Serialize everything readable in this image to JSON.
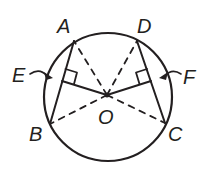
{
  "figure": {
    "type": "geometry-circle-chords",
    "colors": {
      "ink": "#231f20",
      "background": "#ffffff"
    },
    "circle": {
      "center_label": "O",
      "cx": 108,
      "cy": 97,
      "r": 64
    },
    "points": {
      "A": {
        "label": "A",
        "x": 74,
        "y": 41
      },
      "D": {
        "label": "D",
        "x": 137,
        "y": 41
      },
      "B": {
        "label": "B",
        "x": 50,
        "y": 124
      },
      "C": {
        "label": "C",
        "x": 165,
        "y": 123
      },
      "O": {
        "label": "O",
        "x": 107,
        "y": 95
      },
      "E": {
        "label": "E",
        "x": 62,
        "y": 81
      },
      "F": {
        "label": "F",
        "x": 151,
        "y": 81
      }
    },
    "labels": {
      "A": "A",
      "D": "D",
      "E": "E",
      "F": "F",
      "B": "B",
      "O": "O",
      "C": "C"
    },
    "segments": {
      "solid": [
        "AB",
        "DC",
        "OE",
        "OF"
      ],
      "dashed": [
        "OA",
        "OB",
        "OC",
        "OD"
      ]
    },
    "right_angle_marks": [
      "E",
      "F"
    ]
  }
}
